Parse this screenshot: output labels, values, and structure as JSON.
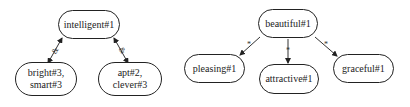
{
  "diagrams": [
    {
      "root": {
        "label": "intelligent#1"
      },
      "children": [
        {
          "label_line1": "bright#3,",
          "label_line2": "smart#3",
          "edge_label": "&"
        },
        {
          "label_line1": "apt#2,",
          "label_line2": "clever#3",
          "edge_label": "&"
        }
      ],
      "edge_style": "bidirectional"
    },
    {
      "root": {
        "label": "beautiful#1"
      },
      "children": [
        {
          "label": "pleasing#1",
          "edge_label": "*"
        },
        {
          "label": "attractive#1",
          "edge_label": "*"
        },
        {
          "label": "graceful#1",
          "edge_label": "*"
        }
      ],
      "edge_style": "directed"
    }
  ]
}
